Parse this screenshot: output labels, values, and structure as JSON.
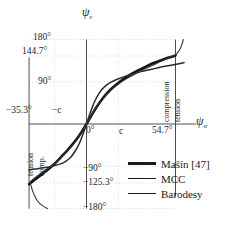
{
  "chart_data": {
    "type": "line",
    "title": "",
    "xlabel": "psi_sigma",
    "ylabel": "psi_epsilon",
    "xlabel_display": "ψ",
    "xlabel_sub": "σ",
    "ylabel_display": "ψ",
    "ylabel_sub": "ε",
    "xlim": [
      -35.3,
      54.7
    ],
    "ylim": [
      -180,
      180
    ],
    "grid": true,
    "legend_position": "bottom-right",
    "x_ticks": [
      {
        "value": -35.3,
        "label": "−35.3°"
      },
      {
        "value": -19.5,
        "label": "−c"
      },
      {
        "value": 0,
        "label": "0°"
      },
      {
        "value": 19.5,
        "label": "c"
      },
      {
        "value": 54.7,
        "label": "54.7°"
      }
    ],
    "y_ticks": [
      {
        "value": 180,
        "label": "180°"
      },
      {
        "value": 144.7,
        "label": "144.7°"
      },
      {
        "value": 90,
        "label": "90°"
      },
      {
        "value": -90,
        "label": "−90°"
      },
      {
        "value": -125.3,
        "label": "−125.3°"
      },
      {
        "value": -180,
        "label": "−180°"
      }
    ],
    "annotations": [
      {
        "text": "tension",
        "position": "left-outer",
        "orientation": "vertical"
      },
      {
        "text": "comp.",
        "position": "left-inner",
        "orientation": "vertical"
      },
      {
        "text": "compression",
        "position": "right-inner",
        "orientation": "vertical"
      },
      {
        "text": "tension",
        "position": "right-outer",
        "orientation": "vertical"
      }
    ],
    "series": [
      {
        "name": "Mašín [47]",
        "style": "thick",
        "color": "#141414",
        "width": 2.6,
        "points": [
          [
            -35.3,
            -128.0
          ],
          [
            -33.0,
            -122.0
          ],
          [
            -30.0,
            -114.0
          ],
          [
            -27.0,
            -106.0
          ],
          [
            -24.0,
            -98.0
          ],
          [
            -21.0,
            -89.0
          ],
          [
            -18.0,
            -79.0
          ],
          [
            -15.0,
            -68.0
          ],
          [
            -12.0,
            -57.0
          ],
          [
            -9.0,
            -45.0
          ],
          [
            -6.0,
            -32.0
          ],
          [
            -3.0,
            -17.0
          ],
          [
            0.0,
            0.0
          ],
          [
            3.0,
            18.0
          ],
          [
            6.0,
            35.0
          ],
          [
            9.0,
            50.0
          ],
          [
            12.0,
            63.0
          ],
          [
            15.0,
            74.0
          ],
          [
            18.0,
            83.0
          ],
          [
            22.0,
            94.0
          ],
          [
            26.0,
            103.0
          ],
          [
            30.0,
            111.0
          ],
          [
            34.0,
            118.0
          ],
          [
            38.0,
            125.0
          ],
          [
            42.0,
            131.0
          ],
          [
            46.0,
            136.0
          ],
          [
            50.0,
            141.0
          ],
          [
            54.7,
            146.0
          ]
        ]
      },
      {
        "name": "MCC",
        "style": "mid",
        "color": "#2b2b2b",
        "width": 1.5,
        "points": [
          [
            -35.3,
            -98.0
          ],
          [
            -32.0,
            -96.0
          ],
          [
            -28.0,
            -94.0
          ],
          [
            -24.0,
            -92.0
          ],
          [
            -20.0,
            -89.0
          ],
          [
            -16.0,
            -85.0
          ],
          [
            -13.0,
            -80.0
          ],
          [
            -10.0,
            -72.0
          ],
          [
            -7.0,
            -58.0
          ],
          [
            -4.5,
            -42.0
          ],
          [
            -2.5,
            -25.0
          ],
          [
            0.0,
            0.0
          ],
          [
            2.5,
            26.0
          ],
          [
            5.0,
            48.0
          ],
          [
            8.0,
            67.0
          ],
          [
            11.0,
            79.0
          ],
          [
            15.0,
            89.0
          ],
          [
            20.0,
            97.0
          ],
          [
            26.0,
            104.0
          ],
          [
            32.0,
            110.0
          ],
          [
            38.0,
            115.0
          ],
          [
            44.0,
            120.0
          ],
          [
            50.0,
            124.0
          ],
          [
            56.0,
            128.0
          ],
          [
            60.0,
            131.0
          ]
        ]
      },
      {
        "name": "Barodesy",
        "style": "thin",
        "color": "#333333",
        "width": 1.1,
        "points": [
          [
            -24.0,
            -180.0
          ],
          [
            -26.0,
            -176.0
          ],
          [
            -28.5,
            -170.0
          ],
          [
            -30.5,
            -162.0
          ],
          [
            -32.0,
            -152.0
          ],
          [
            -33.2,
            -142.0
          ],
          [
            -34.0,
            -132.0
          ],
          [
            -34.6,
            -124.0
          ],
          [
            -33.0,
            -118.0
          ],
          [
            -30.0,
            -110.0
          ],
          [
            -26.0,
            -100.0
          ],
          [
            -22.0,
            -90.0
          ],
          [
            -18.0,
            -79.0
          ],
          [
            -14.0,
            -66.0
          ],
          [
            -10.0,
            -51.0
          ],
          [
            -6.0,
            -34.0
          ],
          [
            -3.0,
            -18.0
          ],
          [
            0.0,
            0.0
          ],
          [
            3.0,
            19.0
          ],
          [
            6.0,
            36.0
          ],
          [
            10.0,
            54.0
          ],
          [
            14.0,
            69.0
          ],
          [
            18.0,
            81.0
          ],
          [
            23.0,
            93.0
          ],
          [
            28.0,
            103.0
          ],
          [
            34.0,
            114.0
          ],
          [
            40.0,
            124.0
          ],
          [
            46.0,
            134.0
          ],
          [
            50.0,
            140.0
          ],
          [
            53.0,
            145.0
          ],
          [
            54.7,
            147.0
          ],
          [
            56.0,
            152.0
          ],
          [
            57.5,
            160.0
          ],
          [
            58.5,
            168.0
          ],
          [
            59.2,
            176.0
          ],
          [
            59.5,
            180.0
          ]
        ]
      }
    ],
    "legend_entries": [
      {
        "label": "Mašín [47]",
        "style": "thick"
      },
      {
        "label": "MCC",
        "style": "mid"
      },
      {
        "label": "Barodesy",
        "style": "thin"
      }
    ]
  },
  "axes_lines": {
    "x_axis_at": 0,
    "y_axis_at": 0,
    "frame_left_at": -35.3,
    "frame_right_at": 54.7
  }
}
